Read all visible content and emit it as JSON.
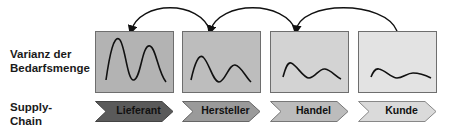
{
  "labels": {
    "variance": [
      "Varianz der",
      "Bedarfsmenge"
    ],
    "supply_chain": [
      "Supply-",
      "Chain"
    ]
  },
  "stages": [
    {
      "name": "Lieferant",
      "box_color": "#b3b3b3",
      "chevron_color": "#5a5a5a"
    },
    {
      "name": "Hersteller",
      "box_color": "#bdbdbd",
      "chevron_color": "#9a9a9a"
    },
    {
      "name": "Handel",
      "box_color": "#d3d3d3",
      "chevron_color": "#bcbcbc"
    },
    {
      "name": "Kunde",
      "box_color": "#e3e3e3",
      "chevron_color": "#dadada"
    }
  ],
  "feedback_arrows": [
    {
      "from": "Kunde",
      "to": "Handel"
    },
    {
      "from": "Handel",
      "to": "Hersteller"
    },
    {
      "from": "Hersteller",
      "to": "Lieferant"
    }
  ]
}
